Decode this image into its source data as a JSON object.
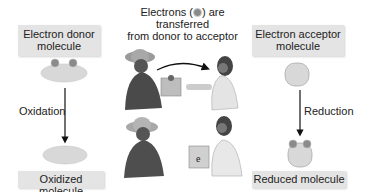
{
  "title": {
    "line1_a": "Electrons (",
    "line1_b": ") are transferred",
    "line2": "from donor to acceptor"
  },
  "donor": {
    "box_label_line1": "Electron donor",
    "box_label_line2": "molecule",
    "process_label": "Oxidation",
    "result_label": "Oxidized molecule"
  },
  "acceptor": {
    "box_label_line1": "Electron acceptor",
    "box_label_line2": "molecule",
    "process_label": "Reduction",
    "result_label": "Reduced molecule"
  },
  "illustration": {
    "box_symbol": "e",
    "top_scene": "donor hands box to acceptor",
    "bottom_scene": "acceptor holds box"
  },
  "colors": {
    "box_bg": "#e4e4e4",
    "molecule_fill": "#d8d8d8",
    "electron_fill": "#8a8a8a",
    "arrow": "#111111"
  }
}
